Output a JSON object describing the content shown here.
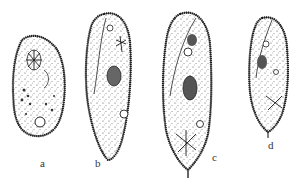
{
  "figure": {
    "organisms": [
      {
        "id": "a",
        "label": "a"
      },
      {
        "id": "b",
        "label": "b"
      },
      {
        "id": "c",
        "label": "c"
      },
      {
        "id": "d",
        "label": "d"
      }
    ],
    "colors": {
      "ink": "#1a1a1a",
      "stipple": "#555555",
      "background": "#ffffff"
    }
  }
}
